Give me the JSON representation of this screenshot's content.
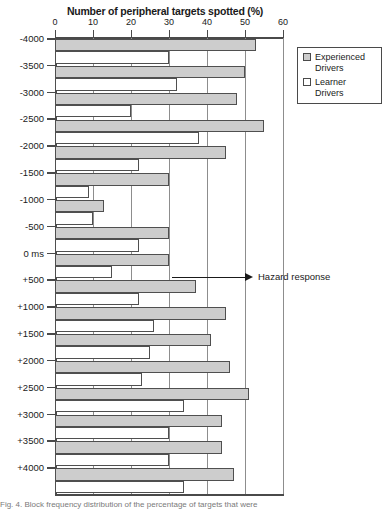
{
  "chart_data": {
    "type": "bar",
    "orientation": "horizontal",
    "title": "Number of peripheral targets spotted (%)",
    "xlabel": "Number of peripheral targets spotted (%)",
    "ylabel": "",
    "xlim": [
      0,
      60
    ],
    "xticks": [
      0,
      10,
      20,
      30,
      40,
      50,
      60
    ],
    "xtick_labels": [
      "0",
      "10",
      "20",
      "30",
      "40",
      "50",
      "60"
    ],
    "grid": true,
    "grid_axis": "x",
    "legend_position": "top-right",
    "categories": [
      "-4000",
      "-3500",
      "-3000",
      "-2500",
      "-2000",
      "-1500",
      "-1000",
      "-500",
      "0 ms",
      "+500",
      "+1000",
      "+1500",
      "+2000",
      "+2500",
      "+3000",
      "+3500",
      "+4000"
    ],
    "series": [
      {
        "name": "Experienced Drivers",
        "color": "#cdcdcd",
        "values": [
          53,
          50,
          48,
          55,
          45,
          30,
          13,
          30,
          30,
          37,
          45,
          41,
          46,
          51,
          44,
          44,
          47
        ]
      },
      {
        "name": "Learner Drivers",
        "color": "#ffffff",
        "values": [
          30,
          32,
          20,
          38,
          22,
          9,
          10,
          22,
          15,
          22,
          26,
          25,
          23,
          34,
          30,
          30,
          34
        ]
      }
    ],
    "annotations": [
      {
        "text": "Hazard response",
        "target_category": "0 ms",
        "style": "arrow-right"
      }
    ]
  },
  "legend": {
    "items": [
      {
        "label": "Experienced Drivers",
        "swatch": "filled-gray-square"
      },
      {
        "label": "Learner Drivers",
        "swatch": "empty-white-square"
      }
    ]
  },
  "caption": {
    "text": "Fig. 4. Block frequency distribution of the percentage of targets that were"
  },
  "icons": {
    "arrow_right": "arrow-right-icon"
  }
}
